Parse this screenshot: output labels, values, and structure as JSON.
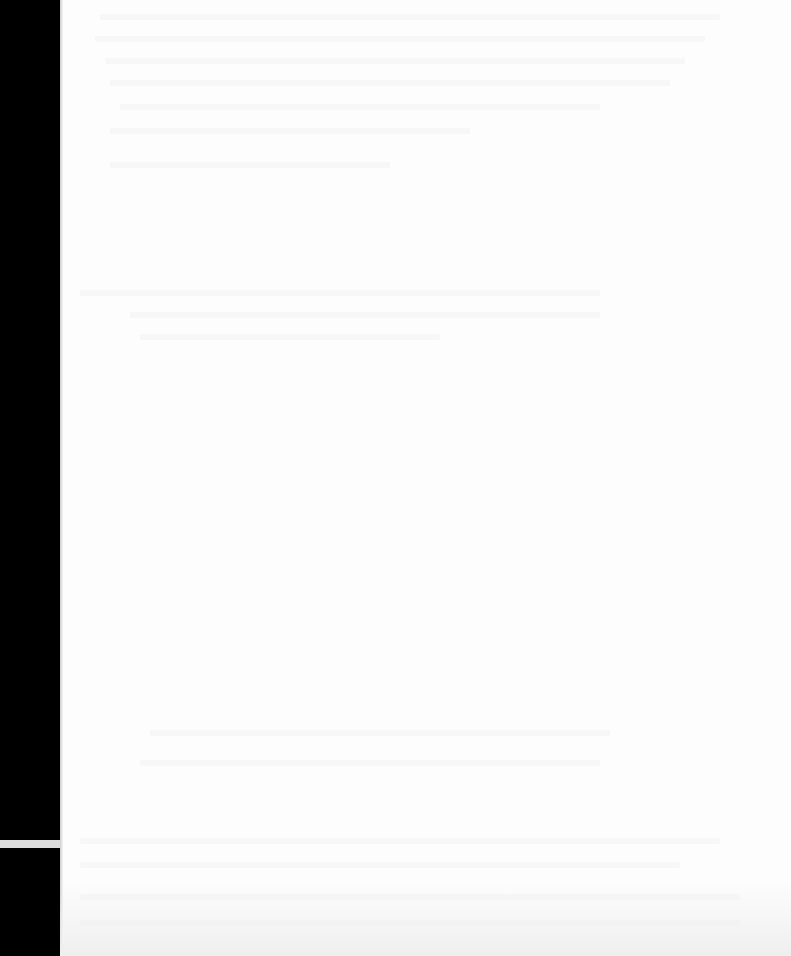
{
  "document": {
    "type": "scanned-page",
    "content": "",
    "note_visible_text": ""
  },
  "colors": {
    "page": "#fdfdfd",
    "background": "#000000",
    "bleed_through": "#f4f4f4"
  },
  "bleed_lines": [
    {
      "x": 100,
      "y": 14,
      "w": 620,
      "h": 6
    },
    {
      "x": 95,
      "y": 36,
      "w": 610,
      "h": 6
    },
    {
      "x": 105,
      "y": 58,
      "w": 580,
      "h": 6
    },
    {
      "x": 110,
      "y": 80,
      "w": 560,
      "h": 6
    },
    {
      "x": 120,
      "y": 104,
      "w": 480,
      "h": 6
    },
    {
      "x": 110,
      "y": 128,
      "w": 360,
      "h": 6
    },
    {
      "x": 110,
      "y": 162,
      "w": 280,
      "h": 6
    },
    {
      "x": 80,
      "y": 290,
      "w": 520,
      "h": 6
    },
    {
      "x": 130,
      "y": 312,
      "w": 470,
      "h": 6
    },
    {
      "x": 140,
      "y": 334,
      "w": 300,
      "h": 6
    },
    {
      "x": 150,
      "y": 730,
      "w": 460,
      "h": 6
    },
    {
      "x": 140,
      "y": 760,
      "w": 460,
      "h": 6
    },
    {
      "x": 80,
      "y": 838,
      "w": 640,
      "h": 6
    },
    {
      "x": 80,
      "y": 862,
      "w": 600,
      "h": 6
    },
    {
      "x": 80,
      "y": 894,
      "w": 660,
      "h": 6
    },
    {
      "x": 80,
      "y": 920,
      "w": 660,
      "h": 6
    }
  ]
}
